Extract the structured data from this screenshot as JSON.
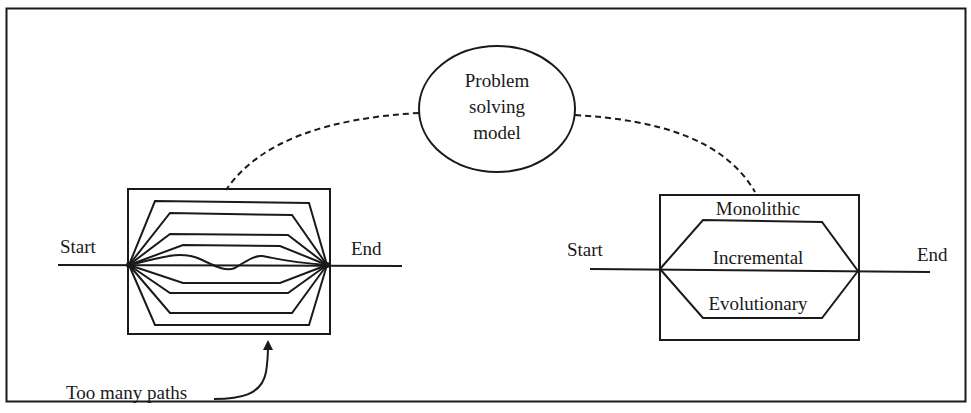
{
  "center_node": {
    "shape": "ellipse",
    "label_lines": [
      "Problem",
      "solving",
      "model"
    ]
  },
  "left_panel": {
    "start_label": "Start",
    "end_label": "End",
    "path_count": 9,
    "annotation": "Too many paths"
  },
  "right_panel": {
    "start_label": "Start",
    "end_label": "End",
    "paths": [
      "Monolithic",
      "Incremental",
      "Evolutionary"
    ]
  },
  "colors": {
    "stroke": "#1a1a1a",
    "background": "#ffffff"
  }
}
